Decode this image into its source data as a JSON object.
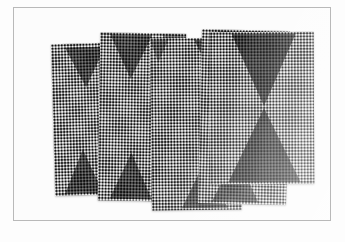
{
  "image": {
    "kind": "photograph",
    "subject": "overlapping perforated mesh metal panel samples",
    "background_color": "#fdfdfd",
    "border_color": "#b9b9b9",
    "alt_text": "Five overlapping rectangular perforated mesh sheets fanned out on a white background, each showing dark triangular motifs in the fine dot weave."
  },
  "frame": {
    "x": 13,
    "y": 7,
    "width": 318,
    "height": 214,
    "line_width_px": 1
  },
  "texture": {
    "name": "hexagonal-dot-mesh",
    "cell_size_px": 3.1,
    "light_color": "#f4f4f4",
    "dark_color": "#111111",
    "base_color": "#8c8c8c"
  },
  "panels": [
    {
      "id": "panel-1",
      "label": "Mesh panel 1 (leftmost)",
      "motifs": [
        "triangle-down-top",
        "triangle-up-bottom"
      ]
    },
    {
      "id": "panel-2",
      "label": "Mesh panel 2",
      "motifs": [
        "triangle-down-top",
        "triangle-up-bottom"
      ]
    },
    {
      "id": "panel-3",
      "label": "Mesh panel 3 (center)",
      "motifs": [
        "triangle-down-top",
        "triangle-up-bottom"
      ]
    },
    {
      "id": "panel-4",
      "label": "Mesh panel 4",
      "motifs": [
        "triangle-down-top",
        "triangle-up-bottom"
      ]
    },
    {
      "id": "panel-5",
      "label": "Mesh panel 5 (rightmost, hourglass motif)",
      "motifs": [
        "triangle-down-top",
        "triangle-up-bottom"
      ]
    }
  ]
}
